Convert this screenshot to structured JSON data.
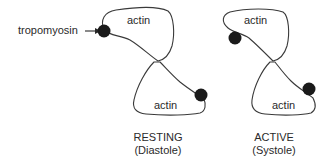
{
  "diagram": {
    "annotation": {
      "label": "tropomyosin",
      "arrow_target": "tropomyosin-left-top"
    },
    "panels": [
      {
        "id": "resting",
        "state_label": "RESTING",
        "phase_label": "(Diastole)",
        "top_lobe_label": "actin",
        "bottom_lobe_label": "actin",
        "tropomyosin_positions": [
          "top-left-outer",
          "bottom-right-outer"
        ]
      },
      {
        "id": "active",
        "state_label": "ACTIVE",
        "phase_label": "(Systole)",
        "top_lobe_label": "actin",
        "bottom_lobe_label": "actin",
        "tropomyosin_positions": [
          "top-left-inner",
          "bottom-right-inner"
        ]
      }
    ],
    "colors": {
      "outline": "#3a3a3a",
      "tropomyosin": "#1a1a1a",
      "text": "#2a2a2a"
    }
  }
}
